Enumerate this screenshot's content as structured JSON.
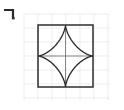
{
  "figure": {
    "background_color": "#ffffff",
    "grid": {
      "visible": true,
      "color": "#e2e2ea",
      "line_width": 0.6,
      "spacing": 14,
      "origin_x": 24,
      "origin_y": 14,
      "x_start": 24,
      "x_end": 110,
      "y_start": 14,
      "y_end": 100,
      "columns": 7,
      "rows": 7
    },
    "square": {
      "color": "#3a3a3a",
      "line_width": 1.6,
      "left": 38,
      "top": 25,
      "right": 93,
      "bottom": 87,
      "width": 55,
      "height": 62
    },
    "astroid": {
      "color": "#2a2a2a",
      "line_width": 1.3,
      "fill": "none",
      "center_x": 65.5,
      "center_y": 56,
      "radius_x": 27.5,
      "radius_y": 31,
      "cusps": [
        {
          "name": "top-cusp",
          "x": 65.5,
          "y": 25
        },
        {
          "name": "right-cusp",
          "x": 93,
          "y": 56
        },
        {
          "name": "bottom-cusp",
          "x": 65.5,
          "y": 87
        },
        {
          "name": "left-cusp",
          "x": 38,
          "y": 56
        }
      ]
    },
    "midlines": {
      "visible": true,
      "color": "#6b6b6b",
      "line_width": 0.8,
      "vertical_x": 65.5,
      "horizontal_y": 56
    },
    "corner_mark": {
      "glyph": "¬",
      "color": "#2a2a2a",
      "x": 4,
      "y": 6,
      "width": 14,
      "height": 12
    }
  }
}
